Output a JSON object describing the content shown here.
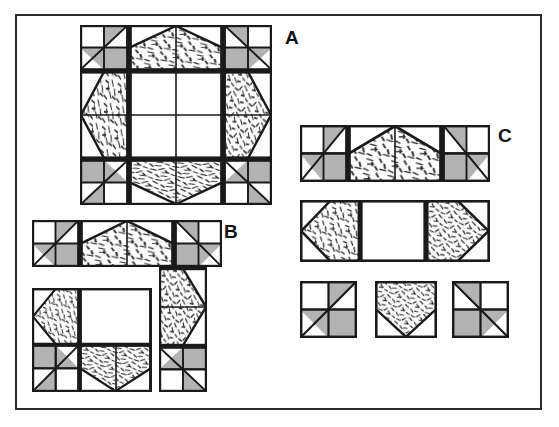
{
  "figure": {
    "background_color": "#ffffff",
    "frame_color": "#2b2b2b",
    "ink_color": "#1a1a1a",
    "shaded_color": "#b3b3b3",
    "plain_color": "#ffffff",
    "print_color": "#ffffff",
    "print_dash_color": "#2b2b2b",
    "type": "quilt-block-assembly-diagram"
  },
  "labels": {
    "a": "A",
    "b": "B",
    "c": "C"
  },
  "blocks": {
    "a": {
      "name": "finished-star-block",
      "caption": "A",
      "grid": "4x4 units, 16 squares",
      "unit_count": 16
    },
    "b": {
      "name": "exploded-assembly-block",
      "caption": "B",
      "grid": "4x4 units shown separated into sections",
      "unit_count": 16
    },
    "c": {
      "name": "component-rows",
      "caption": "C",
      "rows": [
        {
          "name": "top-row",
          "unit_count": 4
        },
        {
          "name": "middle-row",
          "unit_count": 3
        },
        {
          "name": "single-units-row",
          "unit_count": 3
        }
      ]
    }
  },
  "fabrics": [
    {
      "name": "plain-white",
      "swatch": "#ffffff"
    },
    {
      "name": "solid-shaded-gray",
      "swatch": "#b3b3b3"
    },
    {
      "name": "dashed-print",
      "swatch": "#ffffff"
    }
  ]
}
